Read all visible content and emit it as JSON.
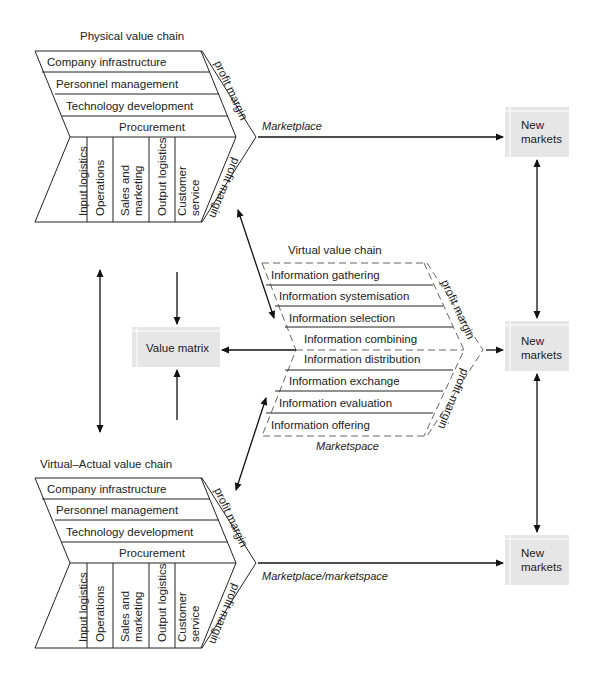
{
  "physical_chain": {
    "title": "Physical value chain",
    "support": [
      "Company infrastructure",
      "Personnel management",
      "Technology development",
      "Procurement"
    ],
    "primary": [
      "Input logistics",
      "Operations",
      "Sales and|marketing",
      "Output logistics",
      "Customer|service"
    ],
    "margin_top": "profit margin",
    "margin_bottom": "profit margin"
  },
  "virtual_chain": {
    "title": "Virtual value chain",
    "rows": [
      "Information gathering",
      "Information systemisation",
      "Information selection",
      "Information combining",
      "Information distribution",
      "Information exchange",
      "Information evaluation",
      "Information offering"
    ],
    "margin_top": "profit margin",
    "margin_bottom": "profit margin",
    "caption": "Marketspace"
  },
  "virtual_actual_chain": {
    "title": "Virtual–Actual value chain",
    "support": [
      "Company infrastructure",
      "Personnel management",
      "Technology development",
      "Procurement"
    ],
    "primary": [
      "Input logistics",
      "Operations",
      "Sales and|marketing",
      "Output logistics",
      "Customer|service"
    ],
    "margin_top": "profit margin",
    "margin_bottom": "profit margin"
  },
  "value_matrix": {
    "label": "Value matrix"
  },
  "new_markets": [
    {
      "line1": "New",
      "line2": "markets"
    },
    {
      "line1": "New",
      "line2": "markets"
    },
    {
      "line1": "New",
      "line2": "markets"
    }
  ],
  "connectors": {
    "top": "Marketplace",
    "bottom": "Marketplace/marketspace"
  },
  "colors": {
    "box_fill": "#e6e6e6",
    "line": "#222222",
    "dash": "#555555"
  }
}
